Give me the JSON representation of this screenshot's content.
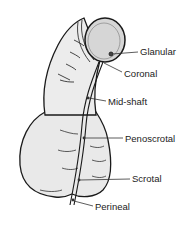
{
  "diagram": {
    "type": "anatomical-illustration",
    "colors": {
      "outline": "#1a1a1a",
      "fill": "#e9e9e9",
      "glans_fill": "#d6d6d6",
      "leader_line": "#333333",
      "text": "#222222"
    },
    "labels": [
      {
        "id": "glanular",
        "text": "Glanular",
        "x": 140,
        "y": 47
      },
      {
        "id": "coronal",
        "text": "Coronal",
        "x": 124,
        "y": 69
      },
      {
        "id": "mid-shaft",
        "text": "Mid-shaft",
        "x": 108,
        "y": 97
      },
      {
        "id": "penoscrotal",
        "text": "Penoscrotal",
        "x": 125,
        "y": 134
      },
      {
        "id": "scrotal",
        "text": "Scrotal",
        "x": 132,
        "y": 174
      },
      {
        "id": "perineal",
        "text": "Perineal",
        "x": 95,
        "y": 202
      }
    ]
  }
}
